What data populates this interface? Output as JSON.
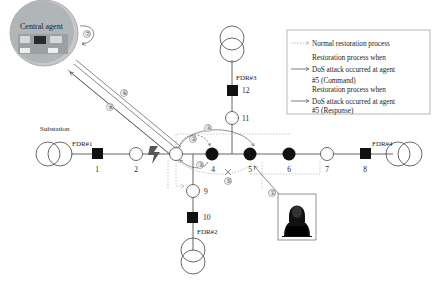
{
  "central_agent": {
    "label": "Central agent"
  },
  "substation": {
    "label": "Substation"
  },
  "feeders": [
    {
      "id": "FDR#1",
      "label": "FDR#1"
    },
    {
      "id": "FDR#2",
      "label": "FDR#2"
    },
    {
      "id": "FDR#3",
      "label": "FDR#3"
    },
    {
      "id": "FDR#4",
      "label": "FDR#4"
    }
  ],
  "nodes": [
    {
      "id": "1",
      "label": "1",
      "type": "breaker"
    },
    {
      "id": "2",
      "label": "2",
      "type": "switch-open"
    },
    {
      "id": "3",
      "label": "",
      "type": "switch-open"
    },
    {
      "id": "4",
      "label": "4",
      "type": "switch-closed"
    },
    {
      "id": "5",
      "label": "5",
      "type": "switch-closed"
    },
    {
      "id": "6",
      "label": "6",
      "type": "switch-closed"
    },
    {
      "id": "7",
      "label": "7",
      "type": "switch-open"
    },
    {
      "id": "8",
      "label": "8",
      "type": "breaker"
    },
    {
      "id": "9",
      "label": "9",
      "type": "switch-open"
    },
    {
      "id": "10",
      "label": "10",
      "type": "breaker"
    },
    {
      "id": "11",
      "label": "11",
      "type": "switch-open"
    },
    {
      "id": "12",
      "label": "12",
      "type": "breaker"
    }
  ],
  "steps": [
    "①",
    "②",
    "③",
    "④",
    "⑤",
    "⑥",
    "⑦",
    "⑧"
  ],
  "legend": {
    "items": [
      {
        "style": "dotted",
        "lines": [
          "Normal restoration process"
        ]
      },
      {
        "style": "solid",
        "lines": [
          "Restoration process when",
          "DoS attack occurred at agent",
          "#5 (Command)"
        ]
      },
      {
        "style": "solid",
        "lines": [
          "Restoration process when",
          "DoS attack occurred at agent",
          "#5 (Response)"
        ]
      }
    ]
  },
  "colors": {
    "line": "#555555",
    "dark": "#111111",
    "dotted": "#999999"
  }
}
